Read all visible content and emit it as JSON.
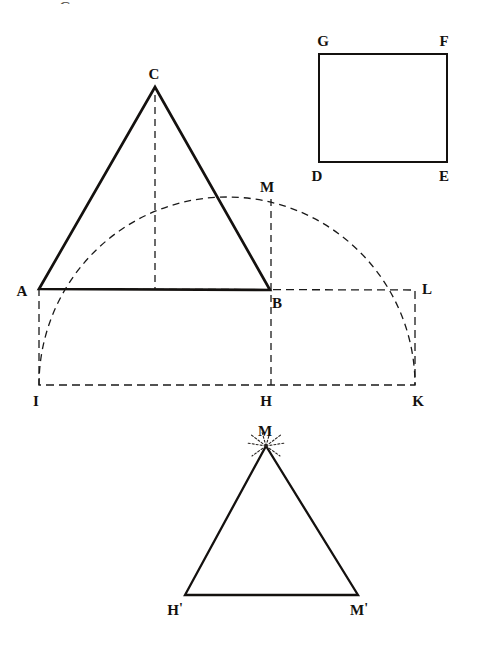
{
  "figure": {
    "kind": "geometry-diagram",
    "ink_color": "#14110f",
    "dash_color": "#1a1a1a",
    "background": "#ffffff",
    "solid_stroke_width": 2.6,
    "dashed_stroke_width": 1.3,
    "cropped_glyph_top": "G"
  },
  "labels": {
    "A": "A",
    "B": "B",
    "C": "C",
    "D": "D",
    "E": "E",
    "F": "F",
    "G": "G",
    "H": "H",
    "I": "I",
    "K": "K",
    "L": "L",
    "M": "M",
    "H_prime": "H",
    "M_prime": "M"
  },
  "points": {
    "A": {
      "x": 39,
      "y": 289,
      "label_x": 22,
      "label_y": 291
    },
    "B": {
      "x": 270,
      "y": 290,
      "label_x": 277,
      "label_y": 303
    },
    "C": {
      "x": 155,
      "y": 87,
      "label_x": 154,
      "label_y": 74
    },
    "M": {
      "x": 271,
      "y": 199,
      "label_x": 267,
      "label_y": 187
    },
    "I": {
      "x": 39,
      "y": 385,
      "label_x": 36,
      "label_y": 401
    },
    "H": {
      "x": 271,
      "y": 385,
      "label_x": 266,
      "label_y": 401
    },
    "K": {
      "x": 415,
      "y": 385,
      "label_x": 418,
      "label_y": 401
    },
    "L": {
      "x": 415,
      "y": 290,
      "label_x": 427,
      "label_y": 289
    },
    "G": {
      "x": 319,
      "y": 54,
      "label_x": 323,
      "label_y": 41
    },
    "F": {
      "x": 447,
      "y": 54,
      "label_x": 444,
      "label_y": 41
    },
    "D": {
      "x": 319,
      "y": 162,
      "label_x": 317,
      "label_y": 176
    },
    "E": {
      "x": 447,
      "y": 162,
      "label_x": 444,
      "label_y": 176
    },
    "M2": {
      "x": 266,
      "y": 446,
      "label_x": 265,
      "label_y": 431
    },
    "H2": {
      "x": 185,
      "y": 595,
      "label_x": 175,
      "label_y": 610
    },
    "M2b": {
      "x": 358,
      "y": 595,
      "label_x": 359,
      "label_y": 610
    }
  },
  "shapes": {
    "triangle_ABC": {
      "name": "triangle-abc",
      "style": "solid",
      "vertices": "A,C,B"
    },
    "square_GFED": {
      "name": "square-gfed",
      "style": "solid",
      "vertices": "G,F,E,D"
    },
    "triangle_MHM": {
      "name": "triangle-m-hprime-mprime",
      "style": "solid",
      "vertices": "M2,H2,M2b"
    },
    "arc_IMK": {
      "name": "semicircle-arc-i-m-k",
      "style": "dashed",
      "center_x": 227,
      "center_y": 385,
      "radius": 188,
      "from": "I",
      "through": "M",
      "to": "K"
    },
    "rect_AIKL": {
      "name": "rectangle-a-i-k-l",
      "style": "dashed",
      "vertices": "A,L,K,I"
    },
    "altitude_CH": {
      "name": "altitude-c-to-h",
      "style": "dashed",
      "from": "C",
      "to": "H"
    },
    "line_MH": {
      "name": "vertical-m-to-h",
      "style": "dashed",
      "from": "M",
      "to": "H"
    },
    "starburst_M2": {
      "name": "starburst-mark-at-m",
      "style": "dotted-rays",
      "at": "M2",
      "rays": 8
    }
  }
}
